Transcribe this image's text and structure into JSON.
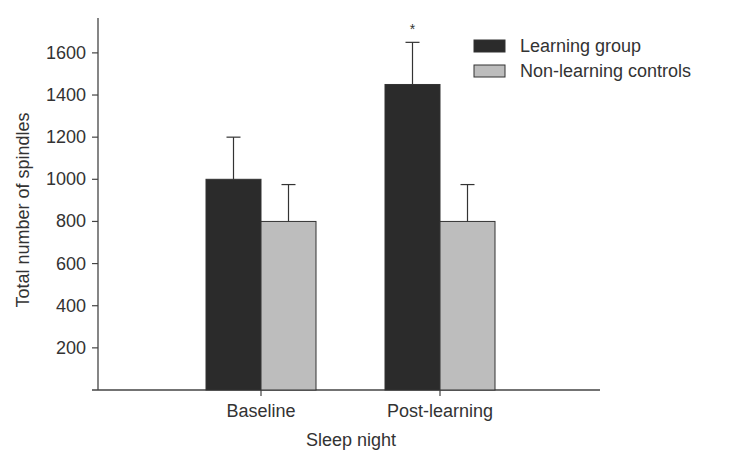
{
  "chart_data": {
    "type": "bar",
    "title": "",
    "xlabel": "Sleep night",
    "ylabel": "Total number of spindles",
    "categories": [
      "Baseline",
      "Post-learning"
    ],
    "series": [
      {
        "name": "Learning group",
        "values": [
          1000,
          1450
        ],
        "error_upper": [
          1200,
          1650
        ],
        "color": "#2b2b2b"
      },
      {
        "name": "Non-learning controls",
        "values": [
          800,
          800
        ],
        "error_upper": [
          975,
          975
        ],
        "color": "#bdbdbd"
      }
    ],
    "yticks": [
      200,
      400,
      600,
      800,
      1000,
      1200,
      1400,
      1600
    ],
    "ylim": [
      0,
      1700
    ],
    "grid": false,
    "legend_position": "top-right",
    "annotations": [
      {
        "text": "*",
        "category": "Post-learning",
        "series": "Learning group"
      }
    ]
  }
}
